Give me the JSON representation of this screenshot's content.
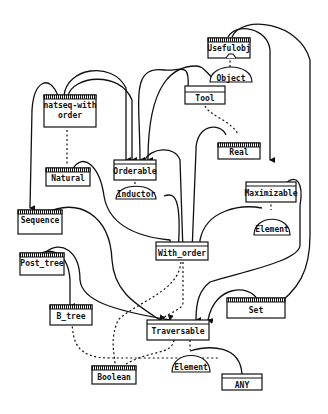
{
  "diagram": {
    "title": "",
    "type": "class-hierarchy",
    "nodes": [
      {
        "id": "usefulobj",
        "label": "Usefulobj",
        "kind": "class",
        "deferred": true
      },
      {
        "id": "object",
        "label": "Object",
        "kind": "generic-param"
      },
      {
        "id": "tool",
        "label": "Tool",
        "kind": "class",
        "deferred": false
      },
      {
        "id": "real",
        "label": "Real",
        "kind": "class",
        "deferred": true
      },
      {
        "id": "natseq",
        "label_line1": "natseq-with",
        "label_line2": "order",
        "kind": "class",
        "deferred": true
      },
      {
        "id": "natural",
        "label": "Natural",
        "kind": "class",
        "deferred": true
      },
      {
        "id": "orderable",
        "label": "Orderable",
        "kind": "class",
        "deferred": false
      },
      {
        "id": "inductor",
        "label": "Inductor",
        "kind": "generic-param"
      },
      {
        "id": "maximizable",
        "label": "Maximizable",
        "kind": "class",
        "deferred": false
      },
      {
        "id": "element1",
        "label": "Element",
        "kind": "generic-param"
      },
      {
        "id": "sequence",
        "label": "Sequence",
        "kind": "class",
        "deferred": true
      },
      {
        "id": "with_order",
        "label": "With_order",
        "kind": "class",
        "deferred": false
      },
      {
        "id": "post_tree",
        "label": "Post_tree",
        "kind": "class",
        "deferred": true
      },
      {
        "id": "b_tree",
        "label": "B_tree",
        "kind": "class",
        "deferred": true
      },
      {
        "id": "set",
        "label": "Set",
        "kind": "class",
        "deferred": true
      },
      {
        "id": "traversable",
        "label": "Traversable",
        "kind": "class",
        "deferred": false
      },
      {
        "id": "boolean",
        "label": "Boolean",
        "kind": "class",
        "deferred": true
      },
      {
        "id": "element2",
        "label": "Element",
        "kind": "generic-param"
      },
      {
        "id": "any",
        "label": "ANY",
        "kind": "class",
        "deferred": false
      }
    ],
    "edges_inherit": [
      [
        "natseq",
        "orderable"
      ],
      [
        "natseq",
        "sequence"
      ],
      [
        "usefulobj",
        "orderable"
      ],
      [
        "usefulobj",
        "maximizable"
      ],
      [
        "usefulobj",
        "set"
      ],
      [
        "natural",
        "with_order"
      ],
      [
        "real",
        "with_order"
      ],
      [
        "orderable",
        "with_order"
      ],
      [
        "sequence",
        "traversable"
      ],
      [
        "post_tree",
        "b_tree"
      ],
      [
        "post_tree",
        "traversable"
      ],
      [
        "with_order",
        "traversable"
      ],
      [
        "set",
        "traversable"
      ],
      [
        "maximizable",
        "traversable"
      ],
      [
        "element2",
        "any"
      ]
    ],
    "edges_client": [
      [
        "natseq",
        "natural"
      ],
      [
        "tool",
        "real"
      ],
      [
        "usefulobj",
        "object"
      ],
      [
        "orderable",
        "inductor"
      ],
      [
        "maximizable",
        "element1"
      ],
      [
        "with_order",
        "traversable"
      ],
      [
        "b_tree",
        "boolean"
      ],
      [
        "traversable",
        "boolean"
      ],
      [
        "traversable",
        "element2"
      ]
    ]
  }
}
